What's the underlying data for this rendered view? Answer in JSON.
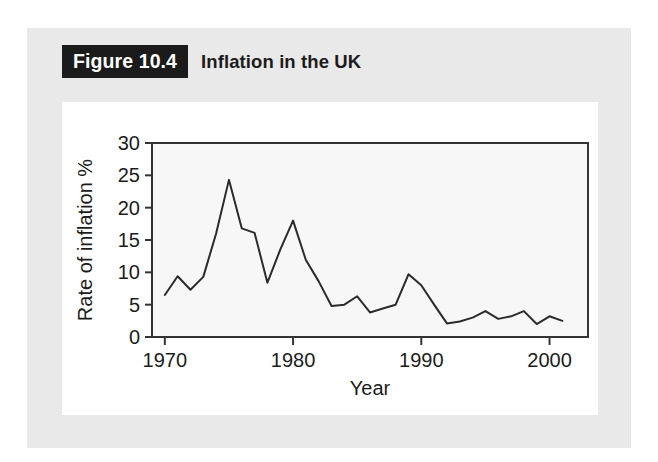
{
  "figure": {
    "number_label": "Figure 10.4",
    "caption": "Inflation in the UK"
  },
  "colors": {
    "band_background": "#e9e9e9",
    "card_background": "#ffffff",
    "plot_background": "#f7f7f7",
    "axis": "#333333",
    "line": "#2b2b2b",
    "label_box": "#1b1b1b",
    "label_text": "#ffffff",
    "text": "#1c1c1c"
  },
  "chart_data": {
    "type": "line",
    "title": "Inflation in the UK",
    "xlabel": "Year",
    "ylabel": "Rate of inflation %",
    "xlim": [
      1969,
      2003
    ],
    "ylim": [
      0,
      30
    ],
    "xticks": [
      1970,
      1980,
      1990,
      2000
    ],
    "xtick_labels": [
      "1970",
      "1980",
      "1990",
      "2000"
    ],
    "yticks": [
      0,
      5,
      10,
      15,
      20,
      25,
      30
    ],
    "ytick_labels": [
      "0",
      "5",
      "10",
      "15",
      "20",
      "25",
      "30"
    ],
    "grid": false,
    "legend": null,
    "series": [
      {
        "name": "Rate of inflation %",
        "x": [
          1970,
          1971,
          1972,
          1973,
          1974,
          1975,
          1976,
          1977,
          1978,
          1979,
          1980,
          1981,
          1982,
          1983,
          1984,
          1985,
          1986,
          1987,
          1988,
          1989,
          1990,
          1991,
          1992,
          1993,
          1994,
          1995,
          1996,
          1997,
          1998,
          1999,
          2000,
          2001
        ],
        "values": [
          6.5,
          9.4,
          7.3,
          9.3,
          16.0,
          24.3,
          16.8,
          16.1,
          8.4,
          13.5,
          18.0,
          11.9,
          8.6,
          4.8,
          5.0,
          6.3,
          3.8,
          4.4,
          5.0,
          9.7,
          8.0,
          5.0,
          2.1,
          2.4,
          3.0,
          4.0,
          2.8,
          3.2,
          4.0,
          2.0,
          3.2,
          2.5
        ]
      }
    ]
  },
  "plot_geometry": {
    "frame_left": 90,
    "frame_right": 526,
    "frame_top": 41,
    "frame_bottom": 235
  }
}
